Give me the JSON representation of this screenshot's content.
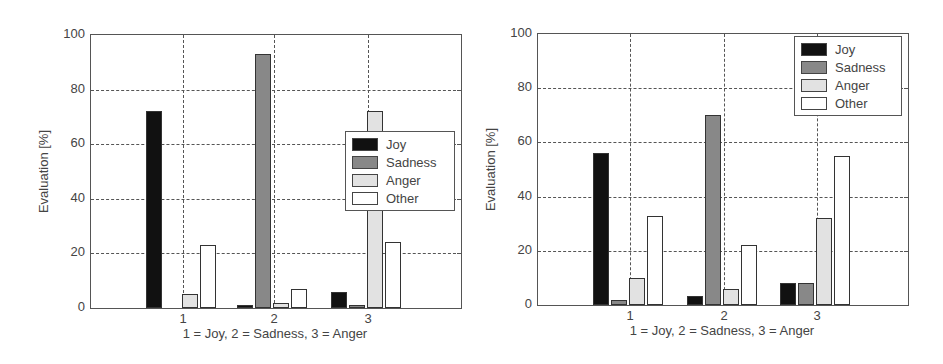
{
  "colors": {
    "Joy": "#111111",
    "Sadness": "#888888",
    "Anger": "#e2e2e2",
    "Other": "#ffffff"
  },
  "chart_data": [
    {
      "type": "bar",
      "title": "",
      "xlabel": "1 = Joy, 2 = Sadness, 3 = Anger",
      "ylabel": "Evaluation [%]",
      "ylim": [
        0,
        100
      ],
      "yticks": [
        "0",
        "20",
        "40",
        "60",
        "80",
        "100"
      ],
      "categories": [
        "1",
        "2",
        "3"
      ],
      "grid": true,
      "legend_position": "right-middle",
      "series": [
        {
          "name": "Joy",
          "values": [
            72,
            1,
            6
          ]
        },
        {
          "name": "Sadness",
          "values": [
            0,
            93,
            1
          ]
        },
        {
          "name": "Anger",
          "values": [
            5,
            2,
            72
          ]
        },
        {
          "name": "Other",
          "values": [
            23,
            7,
            24
          ]
        }
      ]
    },
    {
      "type": "bar",
      "title": "",
      "xlabel": "1 = Joy, 2 = Sadness, 3 = Anger",
      "ylabel": "Evaluation [%]",
      "ylim": [
        0,
        100
      ],
      "yticks": [
        "0",
        "20",
        "40",
        "60",
        "80",
        "100"
      ],
      "categories": [
        "1",
        "2",
        "3"
      ],
      "grid": true,
      "legend_position": "upper-right",
      "series": [
        {
          "name": "Joy",
          "values": [
            56,
            3.5,
            8
          ]
        },
        {
          "name": "Sadness",
          "values": [
            2,
            70,
            8
          ]
        },
        {
          "name": "Anger",
          "values": [
            10,
            6,
            32
          ]
        },
        {
          "name": "Other",
          "values": [
            33,
            22,
            55
          ]
        }
      ]
    }
  ],
  "layout": [
    {
      "left": 0,
      "plot": {
        "x": 90,
        "y": 34,
        "w": 372,
        "h": 275
      },
      "ticks_x": [
        92,
        183,
        277
      ],
      "legend": {
        "x": 345,
        "y": 131,
        "w": 110,
        "h": 80
      }
    },
    {
      "left": 472,
      "plot": {
        "x": 65,
        "y": 33,
        "w": 372,
        "h": 273
      },
      "ticks_x": [
        92,
        186,
        279
      ],
      "legend": {
        "x": 322,
        "y": 36,
        "w": 108,
        "h": 80
      }
    }
  ]
}
